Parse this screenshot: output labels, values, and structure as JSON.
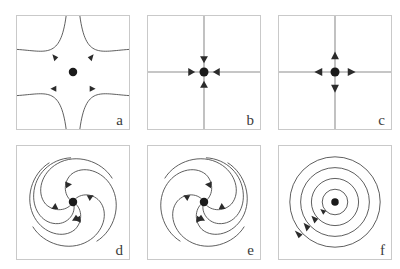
{
  "figure": {
    "width": 400,
    "height": 269,
    "background": "#ffffff",
    "frame_color": "#c9c9c9",
    "curve_color": "#4a4a4a",
    "axis_color": "#8d8d8d",
    "arrow_color": "#2b2b2b",
    "equilibrium_color": "#1a1a1a",
    "label_color": "#3a3a3a",
    "rows": 2,
    "cols": 3
  },
  "panels": [
    {
      "id": "a",
      "label": "a",
      "type": "saddle",
      "name": "saddle-point",
      "stability": "unstable",
      "trajectory_count": 4,
      "trajectory_shape": "hyperbolic",
      "arrow_count": 4,
      "flow": "in along one axis, out along the other",
      "has_axes": false,
      "equilibrium": "center dot"
    },
    {
      "id": "b",
      "label": "b",
      "type": "stable-node",
      "name": "stable-star-node",
      "stability": "stable",
      "trajectory_count": 4,
      "trajectory_shape": "straight rays",
      "arrow_count": 4,
      "flow": "inward toward the equilibrium",
      "has_axes": true,
      "equilibrium": "center dot"
    },
    {
      "id": "c",
      "label": "c",
      "type": "unstable-node",
      "name": "unstable-star-node",
      "stability": "unstable",
      "trajectory_count": 4,
      "trajectory_shape": "straight rays",
      "arrow_count": 4,
      "flow": "outward away from the equilibrium",
      "has_axes": true,
      "equilibrium": "center dot"
    },
    {
      "id": "d",
      "label": "d",
      "type": "stable-spiral",
      "name": "stable-focus-clockwise",
      "stability": "stable",
      "trajectory_count": 5,
      "trajectory_shape": "logarithmic spiral",
      "arrow_count": 5,
      "flow": "spiralling inward, clockwise",
      "has_axes": false,
      "equilibrium": "center dot"
    },
    {
      "id": "e",
      "label": "e",
      "type": "stable-spiral",
      "name": "stable-focus-counterclockwise",
      "stability": "stable",
      "trajectory_count": 5,
      "trajectory_shape": "logarithmic spiral",
      "arrow_count": 5,
      "flow": "spiralling inward, counter-clockwise",
      "has_axes": false,
      "equilibrium": "center dot"
    },
    {
      "id": "f",
      "label": "f",
      "type": "center",
      "name": "center-closed-orbits",
      "stability": "neutrally stable",
      "trajectory_count": 4,
      "trajectory_shape": "concentric closed orbits",
      "arrow_count": 4,
      "flow": "periodic orbits, counter-clockwise",
      "has_axes": false,
      "equilibrium": "center dot"
    }
  ]
}
